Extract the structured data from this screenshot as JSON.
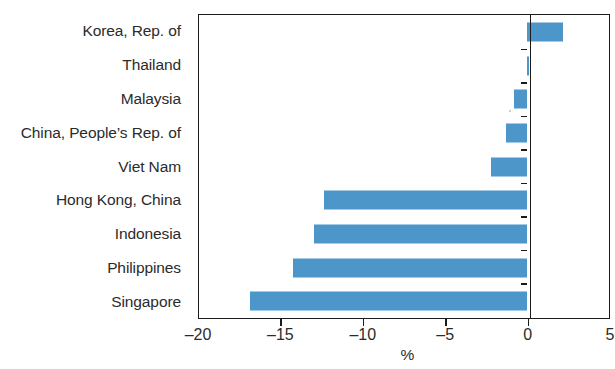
{
  "chart_data": {
    "type": "bar",
    "orientation": "horizontal",
    "title": "",
    "subtitle": "",
    "xlabel": "%",
    "ylabel": "",
    "xlim": [
      -20,
      5
    ],
    "xticks": [
      -20,
      -15,
      -10,
      -5,
      0,
      5
    ],
    "xtick_labels": [
      "–20",
      "–15",
      "–10",
      "–5",
      "0",
      "5"
    ],
    "grid": false,
    "legend": null,
    "zero_line": 0,
    "bar_color": "#4d96ca",
    "axis_color": "#1b1b1b",
    "text_color": "#2b2b2b",
    "categories": [
      "Korea, Rep. of",
      "Thailand",
      "Malaysia",
      "China, People’s Rep. of",
      "Viet Nam",
      "Hong Kong, China",
      "Indonesia",
      "Philippines",
      "Singapore"
    ],
    "values": [
      2.2,
      0.1,
      -0.8,
      -1.3,
      -2.2,
      -12.3,
      -12.9,
      -14.2,
      -16.8
    ],
    "series": [
      {
        "name": "",
        "values": [
          2.2,
          0.1,
          -0.8,
          -1.3,
          -2.2,
          -12.3,
          -12.9,
          -14.2,
          -16.8
        ]
      }
    ]
  },
  "axis": {
    "x_title": "%"
  }
}
